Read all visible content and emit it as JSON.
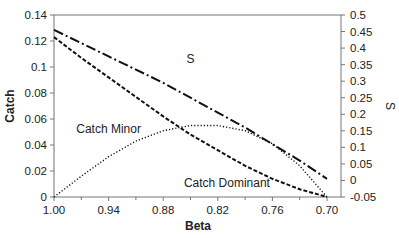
{
  "chart_data": {
    "type": "line",
    "title": "",
    "xlabel": "Beta",
    "ylabel": "Catch",
    "y2label": "S",
    "xlim": [
      1.0,
      0.7
    ],
    "ylim": [
      0,
      0.14
    ],
    "y2lim": [
      -0.05,
      0.5
    ],
    "x_ticks": [
      "1.00",
      "0.94",
      "0.88",
      "0.82",
      "0.76",
      "0.70"
    ],
    "y_ticks": [
      "0",
      "0.02",
      "0.04",
      "0.06",
      "0.08",
      "0.1",
      "0.12",
      "0.14"
    ],
    "y2_ticks": [
      "-0.05",
      "0",
      "0.05",
      "0.1",
      "0.15",
      "0.2",
      "0.25",
      "0.3",
      "0.35",
      "0.4",
      "0.45",
      "0.5"
    ],
    "grid": false,
    "legend": "inline labels",
    "x": [
      1.0,
      0.97,
      0.94,
      0.91,
      0.88,
      0.85,
      0.82,
      0.79,
      0.76,
      0.73,
      0.7
    ],
    "series": [
      {
        "name": "Catch Dominant",
        "axis": "left",
        "style": "dashed",
        "values": [
          0.123,
          0.107,
          0.092,
          0.077,
          0.062,
          0.048,
          0.036,
          0.024,
          0.014,
          0.006,
          0.0
        ]
      },
      {
        "name": "Catch Minor",
        "axis": "left",
        "style": "dotted",
        "values": [
          0.0,
          0.016,
          0.031,
          0.043,
          0.051,
          0.055,
          0.055,
          0.051,
          0.041,
          0.024,
          0.0
        ]
      },
      {
        "name": "S",
        "axis": "right",
        "style": "dash-dot",
        "values": [
          0.455,
          0.415,
          0.375,
          0.335,
          0.295,
          0.25,
          0.205,
          0.16,
          0.11,
          0.06,
          0.005
        ]
      }
    ],
    "annotations": [
      {
        "text": "S",
        "x": 0.85,
        "y2": 0.355
      },
      {
        "text": "Catch Minor",
        "x": 0.94,
        "y": 0.049
      },
      {
        "text": "Catch Dominant",
        "x": 0.81,
        "y": 0.008
      }
    ]
  }
}
